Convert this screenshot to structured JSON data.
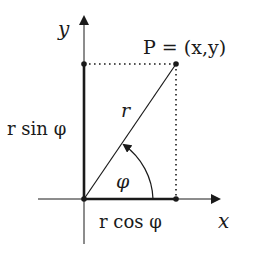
{
  "diagram": {
    "labels": {
      "y_axis": "y",
      "x_axis": "x",
      "point": "P = (x,y)",
      "radius": "r",
      "vertical_projection": "r sin φ",
      "horizontal_projection": "r cos φ",
      "angle": "φ"
    },
    "colors": {
      "ink": "#1a1a1a",
      "background": "#ffffff"
    },
    "geometry": {
      "origin": [
        84,
        199
      ],
      "point_P": [
        176,
        64
      ],
      "x_axis_end": [
        221,
        199
      ],
      "y_axis_end": [
        84,
        15
      ],
      "angle_arc_radius": 69
    }
  }
}
